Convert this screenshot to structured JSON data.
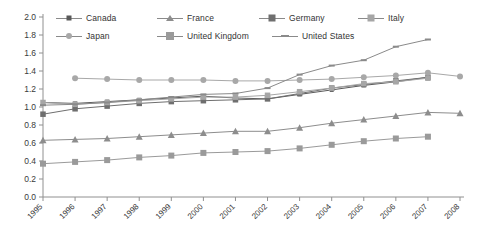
{
  "chart_data": {
    "type": "line",
    "title": "",
    "subtitle": "",
    "xlabel": "",
    "ylabel": "",
    "grid": false,
    "legend_position": "top",
    "ylim": [
      0.0,
      2.0
    ],
    "ytick_labels": [
      "0.0",
      "0.2",
      "0.4",
      "0.6",
      "0.8",
      "1.0",
      "1.2",
      "1.4",
      "1.6",
      "1.8",
      "2.0"
    ],
    "ytick_values": [
      0.0,
      0.2,
      0.4,
      0.6,
      0.8,
      1.0,
      1.2,
      1.4,
      1.6,
      1.8,
      2.0
    ],
    "categories": [
      "1995",
      "1996",
      "1997",
      "1998",
      "1999",
      "2000",
      "2001",
      "2002",
      "2003",
      "2004",
      "2005",
      "2006",
      "2007",
      "2008"
    ],
    "x": [
      1995,
      1996,
      1997,
      1998,
      1999,
      2000,
      2001,
      2002,
      2003,
      2004,
      2005,
      2006,
      2007,
      2008
    ],
    "series": [
      {
        "name": "Canada",
        "marker": "square-small",
        "color": "#595959",
        "values": [
          1.05,
          1.04,
          1.06,
          1.08,
          1.1,
          1.12,
          1.1,
          1.09,
          1.14,
          1.19,
          1.24,
          1.28,
          1.33,
          null
        ]
      },
      {
        "name": "France",
        "marker": "triangle",
        "color": "#8d8d8d",
        "values": [
          0.63,
          0.64,
          0.65,
          0.67,
          0.69,
          0.71,
          0.73,
          0.73,
          0.77,
          0.82,
          0.86,
          0.9,
          0.94,
          0.93
        ]
      },
      {
        "name": "Germany",
        "marker": "square-medium",
        "color": "#6f6f6f",
        "values": [
          0.92,
          0.98,
          1.01,
          1.04,
          1.06,
          1.07,
          1.08,
          1.09,
          1.15,
          1.21,
          1.25,
          1.29,
          1.33,
          null
        ]
      },
      {
        "name": "Italy",
        "marker": "square-large",
        "color": "#a6a6a6",
        "values": [
          1.05,
          1.03,
          1.05,
          1.07,
          1.09,
          1.11,
          1.11,
          1.13,
          1.17,
          1.21,
          1.26,
          1.28,
          1.32,
          null
        ]
      },
      {
        "name": "Japan",
        "marker": "circle",
        "color": "#a8a8a8",
        "values": [
          null,
          1.32,
          1.31,
          1.3,
          1.3,
          1.3,
          1.29,
          1.29,
          1.3,
          1.31,
          1.33,
          1.35,
          1.38,
          1.34
        ]
      },
      {
        "name": "United Kingdom",
        "marker": "square-uk",
        "color": "#9a9a9a",
        "values": [
          0.37,
          0.39,
          0.41,
          0.44,
          0.46,
          0.49,
          0.5,
          0.51,
          0.54,
          0.58,
          0.62,
          0.65,
          0.67,
          null
        ]
      },
      {
        "name": "United States",
        "marker": "dash",
        "color": "#8a8a8a",
        "values": [
          1.02,
          1.03,
          1.05,
          1.08,
          1.11,
          1.14,
          1.15,
          1.21,
          1.36,
          1.46,
          1.52,
          1.67,
          1.75,
          null
        ]
      }
    ]
  },
  "legend": {
    "items": [
      {
        "label": "Canada"
      },
      {
        "label": "France"
      },
      {
        "label": "Germany"
      },
      {
        "label": "Italy"
      },
      {
        "label": "Japan"
      },
      {
        "label": "United Kingdom"
      },
      {
        "label": "United States"
      }
    ]
  }
}
